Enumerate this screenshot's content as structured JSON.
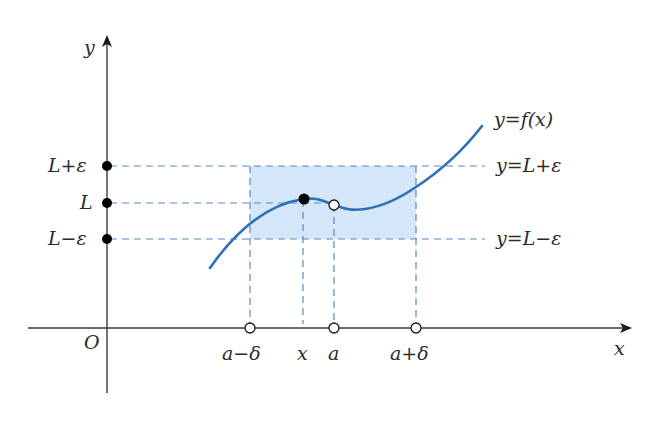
{
  "figure": {
    "colors": {
      "axis": "#3a3a3a",
      "curve": "#2f6fb8",
      "dashed": "#5a86c0",
      "shade": "#d3e7f8",
      "point_fill": "#000000",
      "open_point_fill": "#ffffff"
    },
    "axes": {
      "x_label": "x",
      "y_label": "y",
      "origin_label": "O"
    },
    "y_ticks": [
      {
        "label": "L+ε",
        "name": "L-plus-epsilon"
      },
      {
        "label": "L",
        "name": "L"
      },
      {
        "label": "L−ε",
        "name": "L-minus-epsilon"
      }
    ],
    "x_ticks": [
      {
        "label": "a−δ",
        "name": "a-minus-delta"
      },
      {
        "label": "x",
        "name": "x"
      },
      {
        "label": "a",
        "name": "a"
      },
      {
        "label": "a+δ",
        "name": "a-plus-delta"
      }
    ],
    "curve_label": "y=f(x)",
    "line_labels": {
      "upper": "y=L+ε",
      "lower": "y=L−ε"
    }
  }
}
